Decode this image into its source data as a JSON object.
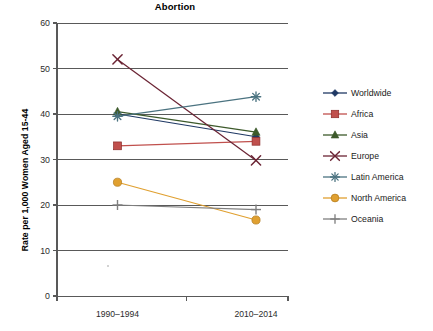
{
  "chart_data": {
    "type": "line",
    "title": "Abortion",
    "xlabel": "",
    "ylabel": "Rate per 1,000 Women Aged 15-44",
    "categories": [
      "1990–1994",
      "2010–2014"
    ],
    "ylim": [
      0,
      60
    ],
    "yticks": [
      0,
      10,
      20,
      30,
      40,
      50,
      60
    ],
    "ytick_labels": [
      "0",
      "10",
      "20",
      "30",
      "40",
      "50",
      "60"
    ],
    "grid": "horizontal",
    "legend_position": "right",
    "series": [
      {
        "name": "Worldwide",
        "values": [
          40.0,
          35.0
        ],
        "color": "#1f3864",
        "marker": "diamond-marker"
      },
      {
        "name": "Africa",
        "values": [
          33.0,
          34.0
        ],
        "color": "#c0504d",
        "marker": "square-marker"
      },
      {
        "name": "Asia",
        "values": [
          40.5,
          36.0
        ],
        "color": "#3d5a2b",
        "marker": "triangle-marker"
      },
      {
        "name": "Europe",
        "values": [
          52.0,
          29.8
        ],
        "color": "#6b2434",
        "marker": "x-marker"
      },
      {
        "name": "Latin America",
        "values": [
          39.5,
          43.8
        ],
        "color": "#4b7380",
        "marker": "asterisk-marker"
      },
      {
        "name": "North America",
        "values": [
          25.0,
          16.7
        ],
        "color": "#e0a030",
        "marker": "circle-marker"
      },
      {
        "name": "Oceania",
        "values": [
          20.0,
          19.0
        ],
        "color": "#7f7f7f",
        "marker": "plus-marker"
      }
    ]
  },
  "legend": {
    "items": [
      {
        "label": "Worldwide"
      },
      {
        "label": "Africa"
      },
      {
        "label": "Asia"
      },
      {
        "label": "Europe"
      },
      {
        "label": "Latin America"
      },
      {
        "label": "North America"
      },
      {
        "label": "Oceania"
      }
    ]
  },
  "axes": {
    "y_title": "Rate per 1,000 Women Aged 15-44",
    "y_tick_labels": [
      "60",
      "50",
      "40",
      "30",
      "20",
      "10",
      "0"
    ],
    "x_tick_labels": [
      "1990–1994",
      "2010–2014"
    ]
  }
}
